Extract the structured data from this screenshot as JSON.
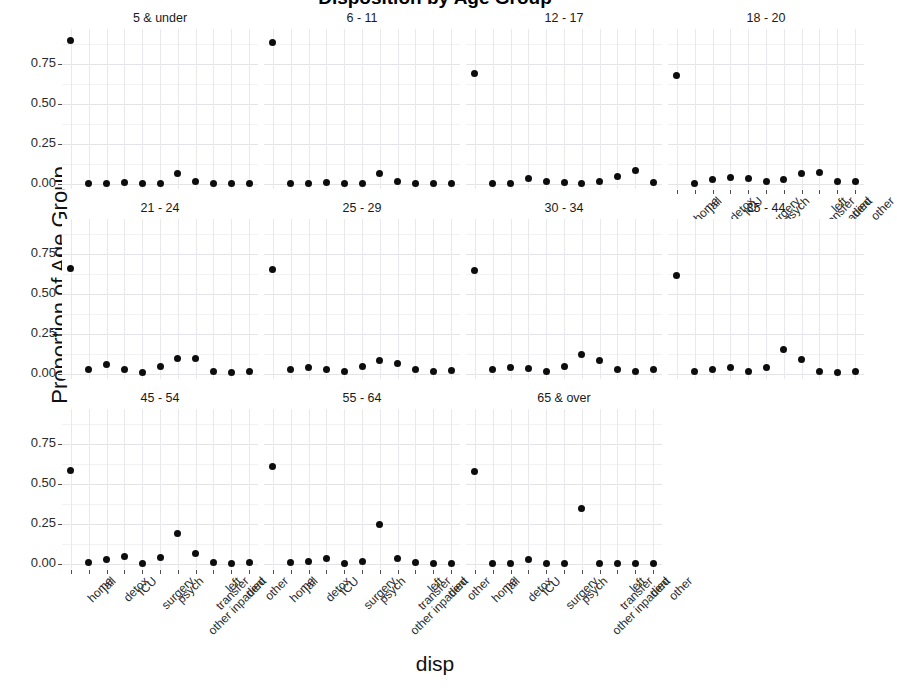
{
  "chart_data": {
    "type": "scatter",
    "title": "Disposition by Age Group",
    "xlabel": "disp",
    "ylabel": "Proportion of Age Group",
    "ylim": [
      -0.03,
      0.97
    ],
    "yticks": [
      "0.00",
      "0.25",
      "0.50",
      "0.75"
    ],
    "ytick_values": [
      0.0,
      0.25,
      0.5,
      0.75
    ],
    "grid": true,
    "legend": "none",
    "facet_layout": {
      "rows": 3,
      "cols": 4
    },
    "categories": [
      "home",
      "jail",
      "detox",
      "ICU",
      "surgery",
      "psych",
      "other inpatient",
      "transfer",
      "left",
      "died",
      "other"
    ],
    "series": [
      {
        "name": "5 & under",
        "values": [
          0.9,
          0.005,
          0.005,
          0.01,
          0.005,
          0.005,
          0.065,
          0.02,
          0.005,
          0.005,
          0.005
        ]
      },
      {
        "name": "6 - 11",
        "values": [
          0.885,
          0.005,
          0.005,
          0.01,
          0.005,
          0.005,
          0.07,
          0.02,
          0.005,
          0.005,
          0.005
        ]
      },
      {
        "name": "12 - 17",
        "values": [
          0.69,
          0.005,
          0.005,
          0.035,
          0.015,
          0.01,
          0.005,
          0.015,
          0.05,
          0.085,
          0.01
        ]
      },
      {
        "name": "18 - 20",
        "values": [
          0.68,
          0.005,
          0.03,
          0.04,
          0.035,
          0.015,
          0.03,
          0.065,
          0.075,
          0.02,
          0.015
        ]
      },
      {
        "name": "21 - 24",
        "values": [
          0.66,
          0.03,
          0.06,
          0.03,
          0.01,
          0.05,
          0.1,
          0.1,
          0.02,
          0.01,
          0.02
        ]
      },
      {
        "name": "25 - 29",
        "values": [
          0.655,
          0.03,
          0.045,
          0.03,
          0.015,
          0.05,
          0.085,
          0.07,
          0.03,
          0.015,
          0.025
        ]
      },
      {
        "name": "30 - 34",
        "values": [
          0.65,
          0.03,
          0.04,
          0.035,
          0.02,
          0.05,
          0.125,
          0.085,
          0.03,
          0.015,
          0.03
        ]
      },
      {
        "name": "35 - 44",
        "values": [
          0.62,
          0.02,
          0.03,
          0.04,
          0.015,
          0.04,
          0.155,
          0.09,
          0.02,
          0.01,
          0.02
        ]
      },
      {
        "name": "45 - 54",
        "values": [
          0.585,
          0.01,
          0.03,
          0.05,
          0.005,
          0.04,
          0.195,
          0.07,
          0.01,
          0.005,
          0.01
        ]
      },
      {
        "name": "55 - 64",
        "values": [
          0.61,
          0.01,
          0.015,
          0.035,
          0.005,
          0.02,
          0.25,
          0.035,
          0.01,
          0.005,
          0.005
        ]
      },
      {
        "name": "65 & over",
        "values": [
          0.58,
          0.005,
          0.005,
          0.03,
          0.005,
          0.005,
          0.35,
          0.005,
          0.005,
          0.005,
          0.005
        ]
      }
    ]
  },
  "axis_note": {
    "x_axis_shown_panels": [
      "18 - 20",
      "45 - 54",
      "55 - 64",
      "65 & over"
    ]
  },
  "style": {
    "point_color": "#0d0d0d",
    "panel_background": "#ffffff",
    "gridline_color": "#e3e3e8",
    "text_color": "#1a1a1a"
  }
}
